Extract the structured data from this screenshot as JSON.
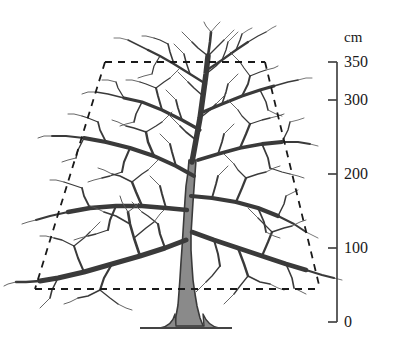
{
  "figure": {
    "type": "tree-height-diagram",
    "background_color": "#ffffff"
  },
  "axis": {
    "unit_label": "cm",
    "ticks": [
      {
        "value": 0,
        "label": "0",
        "y": 322
      },
      {
        "value": 100,
        "label": "100",
        "y": 248
      },
      {
        "value": 200,
        "label": "200",
        "y": 174
      },
      {
        "value": 300,
        "label": "300",
        "y": 100
      },
      {
        "value": 350,
        "label": "350",
        "y": 62
      }
    ],
    "line_x": 337,
    "top_y": 62,
    "bottom_y": 322,
    "tick_length": 9,
    "color": "#444444"
  },
  "canopy_outline": {
    "style": "dashed",
    "color": "#1a1a1a",
    "top_left_x": 105,
    "top_right_x": 265,
    "top_y": 62,
    "bottom_left_x": 35,
    "bottom_right_x": 320,
    "bottom_y": 289
  },
  "ground": {
    "x1": 140,
    "x2": 232,
    "y": 328,
    "color": "#444444"
  },
  "tree": {
    "trunk_fill": "#8a8a8a",
    "branch_color": "#3a3a3a",
    "twig_color": "#555555",
    "base_x": 186,
    "base_y": 328,
    "crown_top_y": 30
  }
}
